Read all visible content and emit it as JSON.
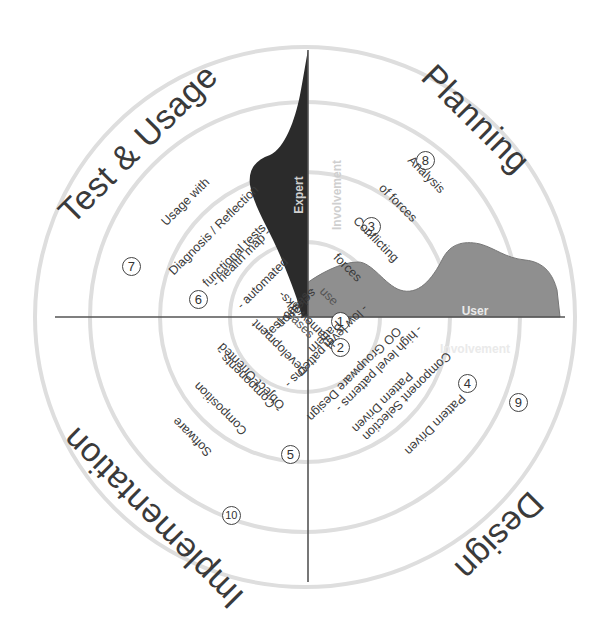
{
  "diagram": {
    "quadrants": [
      {
        "id": "planning",
        "title": "Planning"
      },
      {
        "id": "design",
        "title": "Design"
      },
      {
        "id": "implementation",
        "title": "Implementation"
      },
      {
        "id": "test_usage",
        "title": "Test & Usage"
      }
    ],
    "items": [
      {
        "number": "1",
        "lines": [
          "use",
          "cases"
        ]
      },
      {
        "number": "2",
        "lines": [
          "Pattern",
          "selection"
        ]
      },
      {
        "number": "3",
        "lines": [
          "Conflicting",
          "forces"
        ]
      },
      {
        "number": "4",
        "lines": [
          "Pattern Driven",
          "OO Groupware Design",
          "- low level patterns -"
        ]
      },
      {
        "number": "5",
        "lines": [
          "Object-Oriented",
          "Development",
          "-Frameworks-"
        ]
      },
      {
        "number": "6",
        "lines": [
          "functional tests",
          "- automated",
          "test-cases -"
        ]
      },
      {
        "number": "7",
        "lines": [
          "Usage with",
          "Diagnosis / Reflection",
          "- health map -"
        ]
      },
      {
        "number": "8",
        "lines": [
          "Analysis",
          "of forces"
        ]
      },
      {
        "number": "9",
        "lines": [
          "Pattern Driven",
          "Component Selection",
          "- high level patterns -"
        ]
      },
      {
        "number": "10",
        "lines": [
          "Software",
          "Composition",
          "- Components -"
        ]
      }
    ],
    "areas": {
      "expert": {
        "lines": [
          "Expert",
          "Involvement"
        ],
        "color": "#2b2b2b"
      },
      "user": {
        "lines": [
          "User",
          "Involvement"
        ],
        "color": "#8f8f8f"
      }
    },
    "colors": {
      "background": "#ffffff",
      "axis": "#555555",
      "circles": "#dddddd",
      "text": "#333333"
    }
  }
}
